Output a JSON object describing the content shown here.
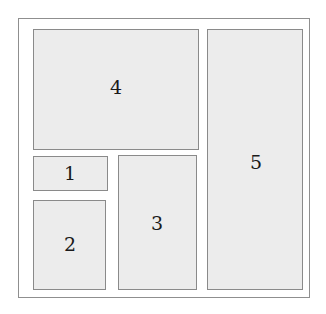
{
  "figure": {
    "type": "rectangle-packing-diagram",
    "width": 326,
    "height": 314,
    "background_color": "#ffffff"
  },
  "container": {
    "name": "bounding-container",
    "x": 18,
    "y": 18,
    "width": 292,
    "height": 280,
    "border_color": "#8f8f8f",
    "fill_color": "#ffffff"
  },
  "style": {
    "rect_fill": "#ececec",
    "rect_border": "#8a8a8a",
    "label_color": "#1a1a1a",
    "label_font_size": 19
  },
  "rectangles": [
    {
      "label": "1",
      "x": 33,
      "y": 156,
      "width": 75,
      "height": 35,
      "label_x": 70,
      "label_y": 173
    },
    {
      "label": "2",
      "x": 33,
      "y": 200,
      "width": 73,
      "height": 90,
      "label_x": 70,
      "label_y": 244
    },
    {
      "label": "3",
      "x": 118,
      "y": 155,
      "width": 79,
      "height": 135,
      "label_x": 157,
      "label_y": 223
    },
    {
      "label": "4",
      "x": 33,
      "y": 29,
      "width": 166,
      "height": 121,
      "label_x": 116,
      "label_y": 87
    },
    {
      "label": "5",
      "x": 207,
      "y": 29,
      "width": 96,
      "height": 261,
      "label_x": 256,
      "label_y": 162
    }
  ]
}
